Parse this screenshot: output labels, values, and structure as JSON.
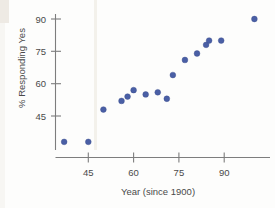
{
  "chart_data": {
    "type": "scatter",
    "title": "",
    "xlabel": "Year (since 1900)",
    "ylabel": "% Responding Yes",
    "xlim": [
      33,
      104
    ],
    "ylim": [
      28,
      95
    ],
    "xticks": [
      45,
      60,
      75,
      90
    ],
    "yticks": [
      45,
      60,
      75,
      90
    ],
    "xticklabels": [
      "45",
      "60",
      "75",
      "90"
    ],
    "yticklabels": [
      "45",
      "60",
      "75",
      "90"
    ],
    "grid": false,
    "legend": null,
    "series": [
      {
        "name": "Responses",
        "color": "#4a5fa5",
        "marker": "circle",
        "points": [
          {
            "x": 37,
            "y": 33
          },
          {
            "x": 45,
            "y": 33
          },
          {
            "x": 50,
            "y": 48
          },
          {
            "x": 56,
            "y": 52
          },
          {
            "x": 58,
            "y": 54
          },
          {
            "x": 60,
            "y": 57
          },
          {
            "x": 64,
            "y": 55
          },
          {
            "x": 68,
            "y": 56
          },
          {
            "x": 71,
            "y": 53
          },
          {
            "x": 73,
            "y": 64
          },
          {
            "x": 77,
            "y": 71
          },
          {
            "x": 81,
            "y": 74
          },
          {
            "x": 84,
            "y": 78
          },
          {
            "x": 85,
            "y": 80
          },
          {
            "x": 89,
            "y": 80
          },
          {
            "x": 100,
            "y": 90
          }
        ]
      }
    ]
  },
  "axes": {
    "x_title": "Year (since 1900)",
    "y_title": "% Responding Yes",
    "x_tick_labels": [
      "45",
      "60",
      "75",
      "90"
    ],
    "y_tick_labels": [
      "45",
      "60",
      "75",
      "90"
    ],
    "axis_color": "#7d7d7d",
    "label_color": "#4a4a4a"
  },
  "style": {
    "point_color": "#4a5fa5",
    "background": "#fdfdfc"
  }
}
